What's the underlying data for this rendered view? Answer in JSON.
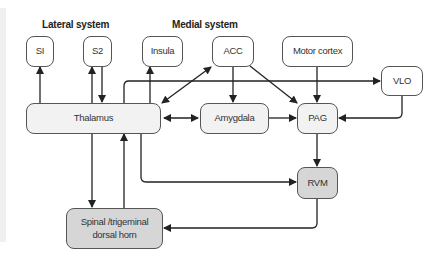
{
  "headings": {
    "lateral": "Lateral system",
    "medial": "Medial system"
  },
  "nodes": {
    "si": "SI",
    "s2": "S2",
    "insula": "Insula",
    "acc": "ACC",
    "motor_cortex": "Motor cortex",
    "vlo": "VLO",
    "thalamus": "Thalamus",
    "amygdala": "Amygdala",
    "pag": "PAG",
    "rvm": "RVM",
    "spinal_line1": "Spinal /trigeminal",
    "spinal_line2": "dorsal horn"
  },
  "edges": [
    {
      "from": "Thalamus",
      "to": "SI"
    },
    {
      "from": "Thalamus",
      "to": "S2"
    },
    {
      "from": "S2",
      "to": "Thalamus"
    },
    {
      "from": "Thalamus",
      "to": "Insula"
    },
    {
      "from": "Thalamus",
      "to": "ACC",
      "bidirectional": true
    },
    {
      "from": "Thalamus",
      "to": "VLO"
    },
    {
      "from": "Thalamus",
      "to": "Amygdala",
      "bidirectional": true
    },
    {
      "from": "ACC",
      "to": "Amygdala"
    },
    {
      "from": "ACC",
      "to": "PAG"
    },
    {
      "from": "Motor cortex",
      "to": "PAG"
    },
    {
      "from": "Amygdala",
      "to": "PAG"
    },
    {
      "from": "VLO",
      "to": "PAG"
    },
    {
      "from": "PAG",
      "to": "RVM"
    },
    {
      "from": "Thalamus",
      "to": "RVM"
    },
    {
      "from": "Thalamus",
      "to": "Spinal /trigeminal dorsal horn"
    },
    {
      "from": "Spinal /trigeminal dorsal horn",
      "to": "Thalamus"
    },
    {
      "from": "RVM",
      "to": "Spinal /trigeminal dorsal horn"
    }
  ],
  "colors": {
    "line": "#222222",
    "node_border": "#555555",
    "node_white": "#ffffff",
    "node_light": "#f2f2f2",
    "node_dark": "#d6d6d6"
  }
}
